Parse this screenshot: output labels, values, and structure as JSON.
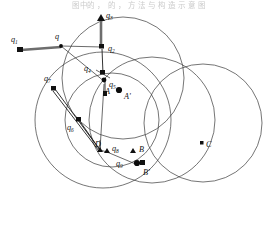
{
  "figure": {
    "caption_top": "图中的 ， 的 ， 方 法 与 构 造 示 意 图",
    "background_color": "#ffffff",
    "stroke_color": "#3a3a3a",
    "marker_color": "#111111",
    "thick_bar_color": "#6e6e6e",
    "width": 278,
    "height": 236
  },
  "chart_data": {
    "type": "scatter",
    "title": "",
    "xlabel": "",
    "ylabel": "",
    "xlim": [
      0,
      278
    ],
    "ylim": [
      236,
      0
    ],
    "grid": false,
    "legend": "none",
    "circles": [
      {
        "name": "circle-1",
        "cx": 123,
        "cy": 78,
        "r": 61
      },
      {
        "name": "circle-2",
        "cx": 103,
        "cy": 120,
        "r": 68
      },
      {
        "name": "circle-3",
        "cx": 112,
        "cy": 120,
        "r": 47
      },
      {
        "name": "circle-4",
        "cx": 152,
        "cy": 120,
        "r": 63
      },
      {
        "name": "circle-5",
        "cx": 203,
        "cy": 123,
        "r": 59
      }
    ],
    "points": [
      {
        "label": "q1",
        "marker": "square",
        "x": 20,
        "y": 50,
        "label_x": 12,
        "label_y": 41
      },
      {
        "label": "q",
        "marker": "vertex",
        "x": 61,
        "y": 46,
        "label_x": 55,
        "label_y": 38
      },
      {
        "label": "q3",
        "marker": "square",
        "x": 101,
        "y": 15,
        "label_x": 106,
        "label_y": 17
      },
      {
        "label": "q2",
        "marker": "square",
        "x": 102,
        "y": 47,
        "label_x": 108,
        "label_y": 50
      },
      {
        "label": "q4",
        "marker": "square",
        "x": 103,
        "y": 72,
        "label_x": 86,
        "label_y": 71
      },
      {
        "label": "q5",
        "marker": "point",
        "x": 105,
        "y": 81,
        "label_x": 110,
        "label_y": 86
      },
      {
        "label": "q7",
        "marker": "square",
        "x": 53,
        "y": 87,
        "label_x": 45,
        "label_y": 80
      },
      {
        "label": "q6",
        "marker": "square",
        "x": 79,
        "y": 119,
        "label_x": 69,
        "label_y": 128
      },
      {
        "label": "q8",
        "marker": "point",
        "x": 106,
        "y": 153,
        "label_x": 110,
        "label_y": 151
      },
      {
        "label": "q9",
        "marker": "point",
        "x": 135,
        "y": 163,
        "label_x": 118,
        "label_y": 164
      },
      {
        "label": "D",
        "marker": "label",
        "x": 101,
        "y": 143,
        "label_x": 98,
        "label_y": 146
      },
      {
        "label": "A",
        "marker": "square",
        "x": 105,
        "y": 93,
        "label_x": 107,
        "label_y": 92
      },
      {
        "label": "A'",
        "marker": "dot",
        "x": 119,
        "y": 90,
        "label_x": 124,
        "label_y": 97
      },
      {
        "label": "B",
        "marker": "triangle",
        "x": 133,
        "y": 152,
        "label_x": 138,
        "label_y": 151
      },
      {
        "label": "B'",
        "marker": "dot",
        "x": 142,
        "y": 163,
        "label_x": 144,
        "label_y": 174
      },
      {
        "label": "C",
        "marker": "square",
        "x": 202,
        "y": 143,
        "label_x": 207,
        "label_y": 146
      }
    ],
    "segments": [
      {
        "name": "q1-to-q",
        "style": "thick",
        "x1": 20,
        "y1": 50,
        "x2": 61,
        "y2": 46
      },
      {
        "name": "q-to-q2",
        "style": "thin",
        "x1": 61,
        "y1": 46,
        "x2": 102,
        "y2": 47
      },
      {
        "name": "q3-arrow",
        "style": "thick",
        "x1": 101,
        "y1": 48,
        "x2": 101,
        "y2": 17
      },
      {
        "name": "q2-to-q4",
        "style": "vec",
        "x1": 102,
        "y1": 49,
        "x2": 103,
        "y2": 74
      },
      {
        "name": "q-to-q5",
        "style": "thin",
        "x1": 61,
        "y1": 46,
        "x2": 105,
        "y2": 82
      },
      {
        "name": "q5-to-A",
        "style": "vec",
        "x1": 105,
        "y1": 82,
        "x2": 105,
        "y2": 95
      },
      {
        "name": "q7-to-D",
        "style": "vec",
        "x1": 54,
        "y1": 88,
        "x2": 100,
        "y2": 150
      },
      {
        "name": "q6-to-D",
        "style": "vec",
        "x1": 79,
        "y1": 120,
        "x2": 100,
        "y2": 150
      },
      {
        "name": "D-to-q8",
        "style": "thin",
        "x1": 100,
        "y1": 150,
        "x2": 107,
        "y2": 152
      },
      {
        "name": "q8-to-q9",
        "style": "thin",
        "x1": 107,
        "y1": 152,
        "x2": 136,
        "y2": 164
      },
      {
        "name": "q5-to-D",
        "style": "thin",
        "x1": 104,
        "y1": 84,
        "x2": 100,
        "y2": 150
      }
    ],
    "labels": [
      "q1",
      "q",
      "q3",
      "q2",
      "q4",
      "q5",
      "q7",
      "q6",
      "q8",
      "q9",
      "D",
      "A",
      "A'",
      "B",
      "B'",
      "C"
    ]
  }
}
